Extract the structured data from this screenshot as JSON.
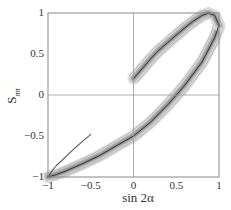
{
  "chart_data": {
    "type": "line",
    "title": "",
    "xlabel": "sin 2α",
    "ylabel": "S_ππ",
    "ylabel_main": "S",
    "ylabel_sub": "ππ",
    "xlim": [
      -1,
      1
    ],
    "ylim": [
      -1,
      1
    ],
    "grid": false,
    "zero_lines": true,
    "x_ticks": [
      -1,
      -0.5,
      0,
      0.5,
      1
    ],
    "x_tick_labels": [
      "−1",
      "−0.5",
      "0",
      "0.5",
      "1"
    ],
    "y_ticks": [
      -1,
      -0.5,
      0,
      0.5,
      1
    ],
    "y_tick_labels": [
      "−1",
      "−0.5",
      "0",
      "0.5",
      "1"
    ],
    "legend": null,
    "series": [
      {
        "name": "thin-line",
        "style": "thin dark line",
        "x": [
          -1.0,
          -0.95,
          -0.9,
          -0.8,
          -0.7,
          -0.6,
          -0.5
        ],
        "y": [
          -1.0,
          -0.92,
          -0.86,
          -0.76,
          -0.66,
          -0.57,
          -0.48
        ]
      },
      {
        "name": "main-loop-lower",
        "style": "central curve with gray confidence bands",
        "x": [
          -1.0,
          -0.9,
          -0.8,
          -0.6,
          -0.4,
          -0.2,
          0.0,
          0.2,
          0.4,
          0.5,
          0.6,
          0.8,
          0.95,
          1.0
        ],
        "y": [
          -1.0,
          -0.97,
          -0.93,
          -0.84,
          -0.74,
          -0.62,
          -0.5,
          -0.33,
          -0.12,
          0.0,
          0.12,
          0.4,
          0.7,
          0.85
        ]
      },
      {
        "name": "main-loop-upper",
        "style": "central curve with gray confidence bands",
        "x": [
          0.0,
          0.1,
          0.2,
          0.3,
          0.4,
          0.5,
          0.6,
          0.7,
          0.8,
          0.88,
          0.95,
          1.0
        ],
        "y": [
          0.2,
          0.32,
          0.44,
          0.55,
          0.64,
          0.73,
          0.82,
          0.9,
          0.97,
          1.0,
          0.97,
          0.85
        ]
      }
    ],
    "colors": {
      "band_outer": "#d9d9d9",
      "band_mid": "#b8b8b8",
      "band_inner": "#8c8c8c",
      "center_line": "#333333",
      "axis": "#888888",
      "zero_line": "#999999"
    }
  }
}
